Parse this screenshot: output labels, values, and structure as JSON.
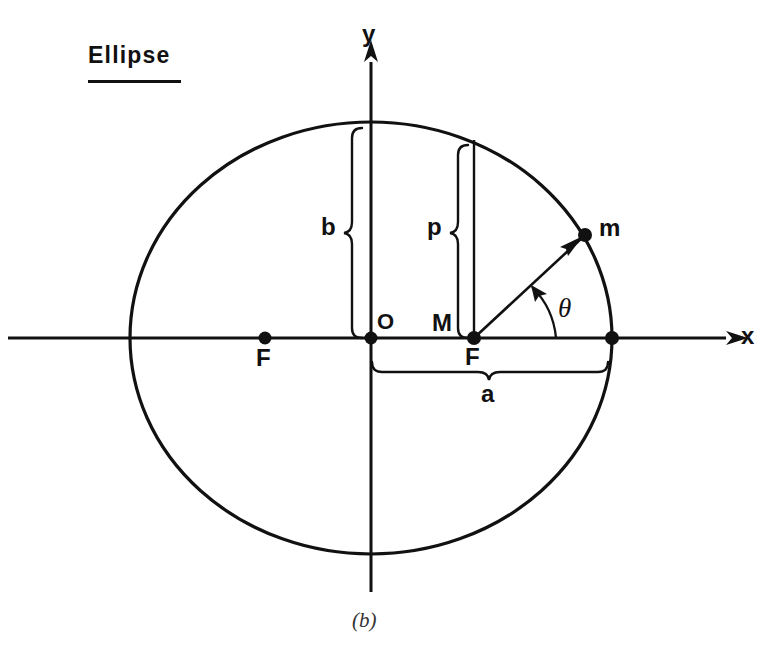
{
  "figure": {
    "title": "Ellipse",
    "caption": "(b)",
    "type": "geometry-diagram"
  },
  "axes": {
    "x_label": "x",
    "y_label": "y",
    "origin_label": "O"
  },
  "points": [
    {
      "name": "left-focus",
      "label": "F",
      "x": 265,
      "y": 338
    },
    {
      "name": "origin",
      "label": "O",
      "x": 371,
      "y": 338
    },
    {
      "name": "right-focus",
      "label": "F",
      "x": 474,
      "y": 338
    },
    {
      "name": "right-vertex",
      "label": "",
      "x": 612,
      "y": 338
    },
    {
      "name": "orbiting-body",
      "label": "m",
      "x": 585,
      "y": 235
    }
  ],
  "measures": {
    "semi_minor_label": "b",
    "semilatus_rectum_label": "p",
    "semi_major_label": "a",
    "foot_point_label": "M",
    "angle_label": "θ"
  },
  "geometry": {
    "center_x": 371,
    "center_y": 338,
    "semi_major_px": 241,
    "semi_minor_px": 216,
    "focus_offset_px": 106
  },
  "colors": {
    "ink": "#111111",
    "background": "#ffffff",
    "caption_ink": "#333333"
  }
}
